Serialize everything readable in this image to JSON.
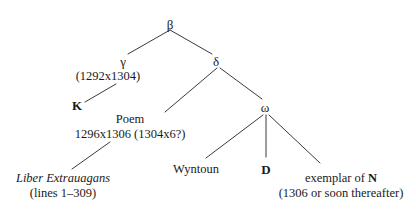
{
  "diagram": {
    "type": "stemma-codicum",
    "width": 416,
    "height": 215,
    "background_color": "#ffffff",
    "ink_color": "#1a1a1a",
    "line_color": "#3a3a3a"
  },
  "nodes": {
    "beta": {
      "label": "β",
      "x": 170,
      "y": 18,
      "style": "greek"
    },
    "gamma": {
      "label": "γ",
      "date": "(1292x1304)",
      "x": 123,
      "y": 55,
      "date_x": 108,
      "date_y": 70,
      "style": "greek"
    },
    "delta": {
      "label": "δ",
      "x": 216,
      "y": 55,
      "style": "greek"
    },
    "k": {
      "label": "K",
      "x": 77,
      "y": 99,
      "style": "sigil"
    },
    "poem": {
      "label": "Poem",
      "date": "1296x1306 (1304x6?)",
      "x": 130,
      "y": 113,
      "date_x": 130,
      "date_y": 128,
      "style": "plain"
    },
    "omega": {
      "label": "ω",
      "x": 265,
      "y": 101,
      "style": "greek"
    },
    "wyntoun": {
      "label": "Wyntoun",
      "x": 196,
      "y": 163,
      "style": "plain"
    },
    "d": {
      "label": "D",
      "x": 266,
      "y": 163,
      "style": "sigil"
    },
    "exemplar": {
      "label_prefix": "exemplar of ",
      "label_sigil": "N",
      "date": "(1306 or soon thereafter)",
      "x": 341,
      "y": 172,
      "date_x": 341,
      "date_y": 187,
      "style": "plain"
    },
    "liber": {
      "label": "Liber Extrauagans",
      "date": "(lines 1–309)",
      "x": 63,
      "y": 172,
      "date_x": 63,
      "date_y": 187,
      "style": "italic"
    }
  },
  "edges": [
    {
      "id": "beta-gamma",
      "from": "beta",
      "to": "gamma",
      "x1": 170,
      "y1": 30,
      "x2": 128,
      "y2": 54
    },
    {
      "id": "beta-delta",
      "from": "beta",
      "to": "delta",
      "x1": 170,
      "y1": 30,
      "x2": 212,
      "y2": 54
    },
    {
      "id": "gamma-k",
      "from": "gamma",
      "to": "k",
      "x1": 116,
      "y1": 84,
      "x2": 85,
      "y2": 102
    },
    {
      "id": "delta-poem",
      "from": "delta",
      "to": "poem",
      "x1": 217,
      "y1": 68,
      "x2": 165,
      "y2": 112
    },
    {
      "id": "delta-omega",
      "from": "delta",
      "to": "omega",
      "x1": 220,
      "y1": 68,
      "x2": 262,
      "y2": 99
    },
    {
      "id": "poem-liber",
      "from": "poem",
      "to": "liber",
      "x1": 110,
      "y1": 142,
      "x2": 72,
      "y2": 169
    },
    {
      "id": "omega-wyntoun",
      "from": "omega",
      "to": "wyntoun",
      "x1": 263,
      "y1": 115,
      "x2": 206,
      "y2": 158
    },
    {
      "id": "omega-d",
      "from": "omega",
      "to": "d",
      "x1": 266,
      "y1": 115,
      "x2": 266,
      "y2": 157
    },
    {
      "id": "omega-exemplar",
      "from": "omega",
      "to": "exemplar",
      "x1": 269,
      "y1": 115,
      "x2": 320,
      "y2": 163
    }
  ]
}
